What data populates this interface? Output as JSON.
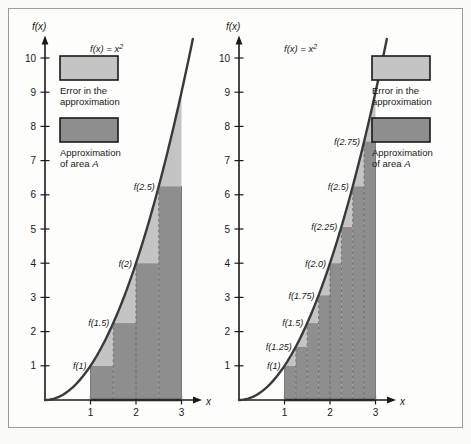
{
  "figure": {
    "background_color": "#fbfbfa",
    "frame_color": "#9b9b9b"
  },
  "colors": {
    "error_fill": "#c4c4c4",
    "approximation_fill": "#8e8e8e",
    "curve": "#3a3a3a",
    "axis": "#1a1a1a",
    "swatch_border": "#1a1a1a"
  },
  "legend": {
    "error": {
      "swatch_name": "error-swatch",
      "line1": "Error in the",
      "line2": "approximation"
    },
    "approximation": {
      "swatch_name": "approximation-swatch",
      "line1": "Approximation",
      "line2_prefix": "of area ",
      "line2_symbol": "A"
    }
  },
  "panels": [
    {
      "id": "left-panel",
      "name": "left-chart",
      "curve_label": "f(x) = x²",
      "y_axis_label": "f(x)",
      "x_axis_label": "x",
      "y_ticks": [
        "1",
        "2",
        "3",
        "4",
        "5",
        "6",
        "7",
        "8",
        "9",
        "10"
      ],
      "x_ticks": [
        "1",
        "2",
        "3"
      ],
      "point_labels": [
        "f(1)",
        "f(1.5)",
        "f(2)",
        "f(2.5)"
      ]
    },
    {
      "id": "right-panel",
      "name": "right-chart",
      "curve_label": "f(x) = x²",
      "y_axis_label": "f(x)",
      "x_axis_label": "x",
      "y_ticks": [
        "1",
        "2",
        "3",
        "4",
        "5",
        "6",
        "7",
        "8",
        "9",
        "10"
      ],
      "x_ticks": [
        "1",
        "2",
        "3"
      ],
      "point_labels": [
        "f(1)",
        "f(1.25)",
        "f(1.5)",
        "f(1.75)",
        "f(2.0)",
        "f(2.25)",
        "f(2.5)",
        "f(2.75)"
      ]
    }
  ],
  "chart_data": {
    "type": "area",
    "function": "f(x) = x^2",
    "xlabel": "x",
    "ylabel": "f(x)",
    "xlim": [
      0,
      3.45
    ],
    "ylim": [
      0,
      10.6
    ],
    "x_ticks": [
      1,
      2,
      3
    ],
    "y_ticks": [
      1,
      2,
      3,
      4,
      5,
      6,
      7,
      8,
      9,
      10
    ],
    "grid": false,
    "legend": [
      "Error in the approximation",
      "Approximation of area A"
    ],
    "charts": [
      {
        "name": "left-chart",
        "interval": [
          1,
          3
        ],
        "n_rectangles": 4,
        "width": 0.5,
        "left_endpoints": [
          1,
          1.5,
          2,
          2.5
        ],
        "rect_heights": [
          1,
          2.25,
          4,
          6.25
        ],
        "labels": [
          "f(1)",
          "f(1.5)",
          "f(2)",
          "f(2.5)"
        ],
        "approximation_sum": 6.75,
        "exact_area": 8.6667,
        "series": [
          {
            "name": "f(x) = x^2",
            "x": [
              0,
              0.5,
              1,
              1.5,
              2,
              2.5,
              3,
              3.25
            ],
            "y": [
              0,
              0.25,
              1,
              2.25,
              4,
              6.25,
              9,
              10.5625
            ]
          }
        ]
      },
      {
        "name": "right-chart",
        "interval": [
          1,
          3
        ],
        "n_rectangles": 8,
        "width": 0.25,
        "left_endpoints": [
          1,
          1.25,
          1.5,
          1.75,
          2,
          2.25,
          2.5,
          2.75
        ],
        "rect_heights": [
          1,
          1.5625,
          2.25,
          3.0625,
          4,
          5.0625,
          6.25,
          7.5625
        ],
        "labels": [
          "f(1)",
          "f(1.25)",
          "f(1.5)",
          "f(1.75)",
          "f(2.0)",
          "f(2.25)",
          "f(2.5)",
          "f(2.75)"
        ],
        "approximation_sum": 7.6875,
        "exact_area": 8.6667,
        "series": [
          {
            "name": "f(x) = x^2",
            "x": [
              0,
              0.5,
              1,
              1.5,
              2,
              2.5,
              3,
              3.25
            ],
            "y": [
              0,
              0.25,
              1,
              2.25,
              4,
              6.25,
              9,
              10.5625
            ]
          }
        ]
      }
    ]
  }
}
